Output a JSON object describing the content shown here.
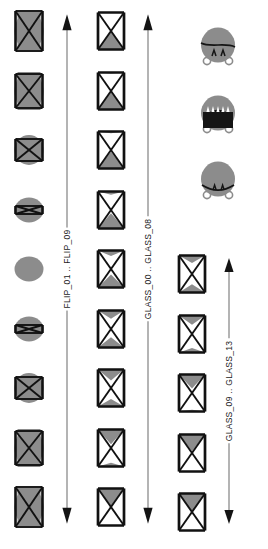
{
  "figure": {
    "orientation": "rotated-90-ccw",
    "background_color": "#ffffff",
    "gray_fill": "#8c8c8c",
    "dark_fill": "#151515",
    "line_color": "#111111"
  },
  "groups": [
    {
      "id": "flip",
      "label": "FLIP_01 .. FLIP_09",
      "count": 9,
      "kind": "flip-sequence",
      "items": [
        {
          "name": "FLIP_01",
          "blob": "wide",
          "frame": "full",
          "fold": 0.0
        },
        {
          "name": "FLIP_02",
          "blob": "wide",
          "frame": "full",
          "fold": 0.15
        },
        {
          "name": "FLIP_03",
          "blob": "medium",
          "frame": "narrowing",
          "fold": 0.45
        },
        {
          "name": "FLIP_04",
          "blob": "round",
          "frame": "sliver",
          "fold": 0.8
        },
        {
          "name": "FLIP_05",
          "blob": "round",
          "frame": "none",
          "fold": 1.0
        },
        {
          "name": "FLIP_06",
          "blob": "round",
          "frame": "sliver",
          "fold": 0.8
        },
        {
          "name": "FLIP_07",
          "blob": "medium",
          "frame": "narrowing",
          "fold": 0.45
        },
        {
          "name": "FLIP_08",
          "blob": "wide",
          "frame": "full",
          "fold": 0.15
        },
        {
          "name": "FLIP_09",
          "blob": "wide",
          "frame": "full",
          "fold": 0.0
        }
      ]
    },
    {
      "id": "glass-a",
      "label": "GLASS_00 .. GLASS_08",
      "count": 9,
      "kind": "glass-sequence",
      "items": [
        {
          "name": "GLASS_00",
          "left_fill": 0.0,
          "right_fill": 0.95
        },
        {
          "name": "GLASS_01",
          "left_fill": 0.2,
          "right_fill": 0.8
        },
        {
          "name": "GLASS_02",
          "left_fill": 0.4,
          "right_fill": 0.6
        },
        {
          "name": "GLASS_03",
          "left_fill": 0.55,
          "right_fill": 0.45
        },
        {
          "name": "GLASS_04",
          "left_fill": 0.7,
          "right_fill": 0.3
        },
        {
          "name": "GLASS_05",
          "left_fill": 0.82,
          "right_fill": 0.18
        },
        {
          "name": "GLASS_06",
          "left_fill": 0.9,
          "right_fill": 0.1
        },
        {
          "name": "GLASS_07",
          "left_fill": 0.95,
          "right_fill": 0.05
        },
        {
          "name": "GLASS_08",
          "left_fill": 1.0,
          "right_fill": 0.0
        }
      ]
    },
    {
      "id": "glass-b",
      "label": "GLASS_09 .. GLASS_13",
      "count": 5,
      "kind": "glass-sequence",
      "items": [
        {
          "name": "GLASS_09",
          "left_fill": 0.0,
          "right_fill": 1.0
        },
        {
          "name": "GLASS_10",
          "left_fill": 0.0,
          "right_fill": 0.9
        },
        {
          "name": "GLASS_11",
          "left_fill": 0.1,
          "right_fill": 0.75
        },
        {
          "name": "GLASS_12",
          "left_fill": 0.25,
          "right_fill": 0.5
        },
        {
          "name": "GLASS_13",
          "left_fill": 0.45,
          "right_fill": 0.4
        }
      ]
    }
  ],
  "bites": [
    {
      "id": "hitsbite",
      "label": "HITSBITE",
      "mouth": "closed-curve",
      "jaw": "dark-outline",
      "teeth": false
    },
    {
      "id": "openbite",
      "label": "OPENBITE",
      "mouth": "open-dark",
      "jaw": "filled-dark",
      "teeth": true
    },
    {
      "id": "missbite",
      "label": "MISSBITE",
      "mouth": "split-seam",
      "jaw": "dark-outline",
      "teeth": false
    }
  ]
}
